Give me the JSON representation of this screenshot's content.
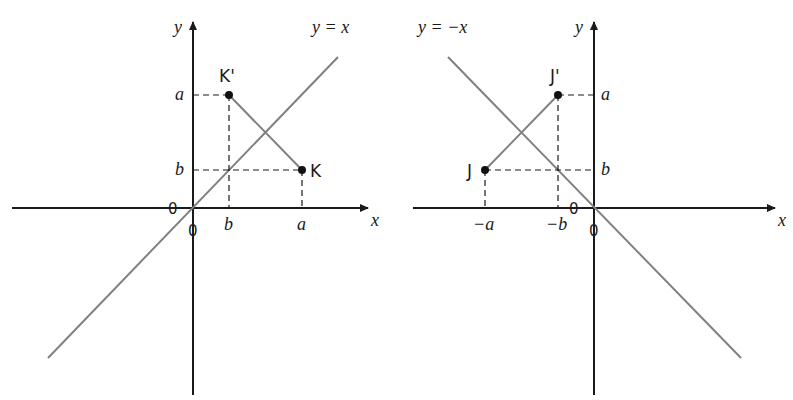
{
  "left_panel": {
    "axis_x_label": "x",
    "axis_y_label": "y",
    "line_label": "y = x",
    "point_K_label": "K",
    "point_K_prime_label": "K'",
    "tick_x_b": "b",
    "tick_x_a": "a",
    "tick_y_a": "a",
    "tick_y_b": "b",
    "origin_label_left": "0",
    "origin_label_below": "0"
  },
  "right_panel": {
    "axis_x_label": "x",
    "axis_y_label": "y",
    "line_label": "y = −x",
    "point_J_label": "J",
    "point_J_prime_label": "J'",
    "tick_x_neg_a": "−a",
    "tick_x_neg_b": "−b",
    "tick_y_a": "a",
    "tick_y_b": "b",
    "origin_label_left": "0",
    "origin_label_below": "0"
  },
  "colors": {
    "axis": "#1a1a1a",
    "reflection_line": "#808080",
    "segment": "#808080",
    "point": "#111111"
  }
}
